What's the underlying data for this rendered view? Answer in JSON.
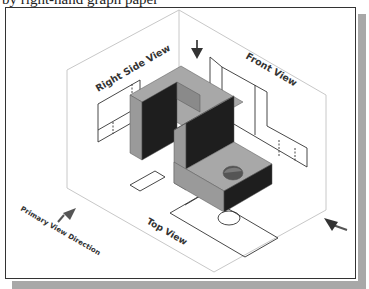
{
  "document": {
    "cut_off_line": "by right-hand graph paper"
  },
  "figure": {
    "title_labels": {
      "right_side_view": "Right Side View",
      "front_view": "Front View",
      "top_view": "Top View",
      "primary_view_direction": "Primary View Direction"
    },
    "colors": {
      "frame_border": "#333333",
      "shadow": "#a8a8a8",
      "box_lines": "#c8c8c8",
      "projection_lines": "#333333",
      "solid_top": "#a8a8a8",
      "solid_light": "#9a9a9a",
      "solid_dark": "#1e1e1e",
      "arrow": "#555555"
    },
    "arrows": [
      {
        "name": "top-view-arrow",
        "direction": "down"
      },
      {
        "name": "primary-view-arrow",
        "direction": "up-right"
      },
      {
        "name": "side-view-arrow",
        "direction": "left"
      }
    ]
  }
}
